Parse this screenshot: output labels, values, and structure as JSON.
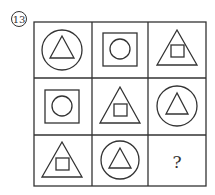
{
  "problem_number": "13",
  "grid": {
    "rows": 3,
    "cols": 3,
    "cells": [
      {
        "row": 0,
        "col": 0,
        "outer": "circle",
        "inner": "triangle"
      },
      {
        "row": 0,
        "col": 1,
        "outer": "square",
        "inner": "circle"
      },
      {
        "row": 0,
        "col": 2,
        "outer": "triangle",
        "inner": "square"
      },
      {
        "row": 1,
        "col": 0,
        "outer": "square",
        "inner": "circle"
      },
      {
        "row": 1,
        "col": 1,
        "outer": "triangle",
        "inner": "square"
      },
      {
        "row": 1,
        "col": 2,
        "outer": "circle",
        "inner": "triangle"
      },
      {
        "row": 2,
        "col": 0,
        "outer": "triangle",
        "inner": "square"
      },
      {
        "row": 2,
        "col": 1,
        "outer": "circle",
        "inner": "triangle"
      },
      {
        "row": 2,
        "col": 2,
        "outer": "unknown",
        "inner": "unknown",
        "label": "?"
      }
    ]
  },
  "colors": {
    "stroke": "#333333",
    "background": "#ffffff"
  }
}
